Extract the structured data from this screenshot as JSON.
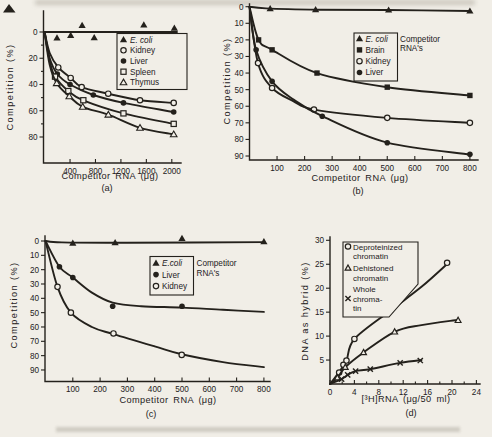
{
  "colors": {
    "ink": "#24211c",
    "paper": "#f1eee7"
  },
  "artifacts": {
    "stray_mark": "filled-triangle-top-left",
    "top_smudge": true,
    "caption_smudge": true
  },
  "chart_data": [
    {
      "panel": "a",
      "type": "line",
      "panel_label": "(a)",
      "xlabel": "Competitor RNA (μg)",
      "ylabel": "Competition (%)",
      "x_ticks": [
        400,
        800,
        1200,
        1600,
        2000
      ],
      "y_ticks": [
        0,
        20,
        40,
        60,
        80
      ],
      "y_minor": [
        10,
        30,
        50,
        70
      ],
      "xlim": [
        0,
        2100
      ],
      "ylim": [
        -8,
        100
      ],
      "y_axis_inverted_downward": true,
      "grid": false,
      "series": [
        {
          "name": "E. coli",
          "italic": true,
          "marker": "triangle-filled",
          "lw": 2.2,
          "line": [
            [
              0,
              0
            ],
            [
              2080,
              0
            ]
          ],
          "markers": [
            [
              195,
              4.5
            ],
            [
              410,
              2.5
            ],
            [
              590,
              -5
            ],
            [
              780,
              4.3
            ],
            [
              1560,
              -5.5
            ],
            [
              2040,
              -3
            ]
          ]
        },
        {
          "name": "Kidney",
          "marker": "circle-open",
          "line": [
            [
              0,
              0
            ],
            [
              80,
              16
            ],
            [
              215,
              27
            ],
            [
              410,
              35
            ],
            [
              583,
              42
            ],
            [
              1000,
              47
            ],
            [
              1500,
              52
            ],
            [
              2030,
              54
            ]
          ],
          "markers": [
            [
              215,
              27
            ],
            [
              410,
              35
            ],
            [
              583,
              42
            ],
            [
              1000,
              47
            ],
            [
              1500,
              52
            ],
            [
              2030,
              54
            ]
          ]
        },
        {
          "name": "Liver",
          "marker": "circle-filled",
          "line": [
            [
              0,
              0
            ],
            [
              80,
              20
            ],
            [
              200,
              32
            ],
            [
              400,
              40
            ],
            [
              766,
              48
            ],
            [
              1240,
              54
            ],
            [
              2030,
              61
            ]
          ],
          "markers": [
            [
              200,
              32
            ],
            [
              400,
              40
            ],
            [
              766,
              48
            ],
            [
              1240,
              54
            ],
            [
              2030,
              61
            ]
          ]
        },
        {
          "name": "Spleen",
          "marker": "square-open",
          "line": [
            [
              0,
              0
            ],
            [
              80,
              22
            ],
            [
              164,
              34
            ],
            [
              373,
              45
            ],
            [
              609,
              52
            ],
            [
              1240,
              62
            ],
            [
              2030,
              70
            ]
          ],
          "markers": [
            [
              164,
              34
            ],
            [
              373,
              45
            ],
            [
              609,
              52
            ],
            [
              1240,
              62
            ],
            [
              2030,
              70
            ]
          ]
        },
        {
          "name": "Thymus",
          "marker": "triangle-open",
          "line": [
            [
              0,
              0
            ],
            [
              80,
              25
            ],
            [
              190,
              39
            ],
            [
              388,
              49
            ],
            [
              599,
              57
            ],
            [
              1002,
              63
            ],
            [
              1500,
              73
            ],
            [
              2030,
              78
            ]
          ],
          "markers": [
            [
              190,
              39
            ],
            [
              388,
              49
            ],
            [
              599,
              57
            ],
            [
              1002,
              63
            ],
            [
              1500,
              73
            ],
            [
              2030,
              78
            ]
          ]
        }
      ],
      "legend": {
        "entries": [
          {
            "marker": "triangle-filled",
            "label": "E. coli",
            "italic": true
          },
          {
            "marker": "circle-open",
            "label": "Kidney"
          },
          {
            "marker": "circle-filled",
            "label": "Liver"
          },
          {
            "marker": "square-open",
            "label": "Spleen"
          },
          {
            "marker": "triangle-open",
            "label": "Thymus"
          }
        ]
      }
    },
    {
      "panel": "b",
      "type": "line",
      "panel_label": "(b)",
      "xlabel": "Competitor RNA (μg)",
      "ylabel": "Competition (%)",
      "x_ticks": [
        100,
        200,
        300,
        400,
        500,
        600,
        700,
        800
      ],
      "y_ticks": [
        0,
        10,
        20,
        30,
        40,
        50,
        60,
        70,
        80,
        90
      ],
      "xlim": [
        0,
        830
      ],
      "ylim": [
        0,
        92
      ],
      "y_axis_inverted_downward": true,
      "grid": false,
      "series": [
        {
          "name": "E. coli",
          "italic": true,
          "marker": "triangle-filled",
          "line": [
            [
              0,
              0
            ],
            [
              60,
              1
            ],
            [
              250,
              1.8
            ],
            [
              500,
              2
            ],
            [
              800,
              2.6
            ]
          ],
          "markers": [
            [
              75,
              1.2
            ],
            [
              240,
              1.8
            ],
            [
              505,
              2
            ],
            [
              800,
              2.6
            ]
          ]
        },
        {
          "name": "Brain",
          "marker": "square-filled",
          "line": [
            [
              0,
              0
            ],
            [
              33,
              20
            ],
            [
              82,
              26
            ],
            [
              245,
              40
            ],
            [
              500,
              48.5
            ],
            [
              800,
              53.5
            ]
          ],
          "markers": [
            [
              33,
              20
            ],
            [
              82,
              26
            ],
            [
              245,
              40
            ],
            [
              500,
              48.5
            ],
            [
              800,
              53.5
            ]
          ]
        },
        {
          "name": "Kidney",
          "marker": "circle-open",
          "line": [
            [
              0,
              0
            ],
            [
              31,
              34
            ],
            [
              82,
              49
            ],
            [
              160,
              57
            ],
            [
              234,
              62
            ],
            [
              500,
              67
            ],
            [
              800,
              70
            ]
          ],
          "markers": [
            [
              31,
              34
            ],
            [
              82,
              49
            ],
            [
              234,
              62
            ],
            [
              500,
              67
            ],
            [
              800,
              70
            ]
          ]
        },
        {
          "name": "Liver",
          "marker": "circle-filled",
          "line": [
            [
              0,
              0
            ],
            [
              24,
              26
            ],
            [
              82,
              45
            ],
            [
              160,
              56
            ],
            [
              264,
              66
            ],
            [
              500,
              82
            ],
            [
              800,
              89
            ]
          ],
          "markers": [
            [
              24,
              26
            ],
            [
              82,
              45
            ],
            [
              264,
              66
            ],
            [
              500,
              82
            ],
            [
              800,
              89
            ]
          ]
        }
      ],
      "legend": {
        "entries": [
          {
            "marker": "triangle-filled",
            "label": "E. coli",
            "italic": true
          },
          {
            "marker": "square-filled",
            "label": "Brain"
          },
          {
            "marker": "circle-open",
            "label": "Kidney"
          },
          {
            "marker": "circle-filled",
            "label": "Liver"
          }
        ],
        "side_text": [
          "Competitor",
          "RNA's"
        ]
      }
    },
    {
      "panel": "c",
      "type": "line",
      "panel_label": "(c)",
      "xlabel": "Competitor RNA (μg)",
      "ylabel": "Competition (%)",
      "x_ticks": [
        100,
        200,
        300,
        400,
        500,
        600,
        700,
        800
      ],
      "y_ticks": [
        0,
        10,
        20,
        30,
        40,
        50,
        60,
        70,
        80,
        90
      ],
      "xlim": [
        0,
        830
      ],
      "ylim": [
        -4,
        98
      ],
      "y_axis_inverted_downward": true,
      "grid": false,
      "series": [
        {
          "name": "E.coli",
          "italic": true,
          "marker": "triangle-filled",
          "line": [
            [
              0,
              0
            ],
            [
              60,
              1
            ],
            [
              300,
              1.2
            ],
            [
              800,
              0.8
            ]
          ],
          "markers": [
            [
              100,
              1.5
            ],
            [
              255,
              1.2
            ],
            [
              500,
              -1.9
            ],
            [
              800,
              0.5
            ]
          ]
        },
        {
          "name": "Liver",
          "marker": "circle-filled",
          "line": [
            [
              0,
              0
            ],
            [
              51,
              18
            ],
            [
              100,
              25.5
            ],
            [
              170,
              36
            ],
            [
              246,
              43
            ],
            [
              350,
              45.5
            ],
            [
              500,
              46.5
            ],
            [
              650,
              48
            ],
            [
              800,
              49.5
            ]
          ],
          "markers": [
            [
              51,
              18
            ],
            [
              100,
              25.5
            ],
            [
              246,
              45.5
            ],
            [
              500,
              45.5
            ]
          ]
        },
        {
          "name": "Kidney",
          "marker": "circle-open",
          "line": [
            [
              0,
              0
            ],
            [
              44,
              32
            ],
            [
              93,
              50
            ],
            [
              170,
              60
            ],
            [
              249,
              65
            ],
            [
              400,
              73.5
            ],
            [
              499,
              79
            ],
            [
              650,
              84.5
            ],
            [
              800,
              88
            ]
          ],
          "markers": [
            [
              44,
              32
            ],
            [
              93,
              50
            ],
            [
              249,
              64.5
            ],
            [
              499,
              79.5
            ]
          ]
        }
      ],
      "legend": {
        "entries": [
          {
            "marker": "triangle-filled",
            "label": "E.coli",
            "italic": true
          },
          {
            "marker": "circle-filled",
            "label": "Liver"
          },
          {
            "marker": "circle-open",
            "label": "Kidney"
          }
        ],
        "side_text": [
          "Competitor",
          "RNA's"
        ]
      }
    },
    {
      "panel": "d",
      "type": "line",
      "panel_label": "(d)",
      "xlabel": "[³H]RNA (μg/50 ml)",
      "ylabel": "DNA as hybrid (%)",
      "x_ticks": [
        0,
        4,
        8,
        12,
        16,
        20,
        24
      ],
      "x_minor": [
        2,
        6,
        10,
        14,
        18,
        22
      ],
      "y_ticks": [
        5,
        10,
        15,
        20,
        25,
        30
      ],
      "xlim": [
        0,
        24.5
      ],
      "ylim": [
        0,
        30
      ],
      "y_axis_inverted_downward": false,
      "grid": false,
      "series": [
        {
          "name": "Deproteinized chromatin",
          "marker": "circle-open",
          "line": [
            [
              0,
              0
            ],
            [
              1.5,
              2.5
            ],
            [
              2.7,
              4.9
            ],
            [
              4,
              9.4
            ],
            [
              10,
              15.4
            ],
            [
              15,
              20.3
            ],
            [
              19.5,
              25.4
            ]
          ],
          "markers": [
            [
              1.5,
              2.4
            ],
            [
              2.2,
              4
            ],
            [
              2.7,
              4.9
            ],
            [
              4,
              9.4
            ],
            [
              9.9,
              15.4
            ],
            [
              19.2,
              25.3
            ]
          ]
        },
        {
          "name": "Dehistoned chromatin",
          "marker": "triangle-open-small",
          "line": [
            [
              0,
              0
            ],
            [
              1.2,
              1.3
            ],
            [
              2.5,
              3.5
            ],
            [
              5.5,
              6.6
            ],
            [
              10.6,
              10.9
            ],
            [
              15,
              12.3
            ],
            [
              21,
              13.4
            ]
          ],
          "markers": [
            [
              1.2,
              1.3
            ],
            [
              2.5,
              3.5
            ],
            [
              5.5,
              6.6
            ],
            [
              10.6,
              10.9
            ],
            [
              21,
              13.3
            ]
          ]
        },
        {
          "name": "Whole chromatin",
          "marker": "cross",
          "line": [
            [
              0,
              0
            ],
            [
              1.9,
              1
            ],
            [
              3,
              2
            ],
            [
              4.2,
              2.7
            ],
            [
              6.6,
              3.1
            ],
            [
              11.5,
              4.4
            ],
            [
              15,
              5
            ]
          ],
          "markers": [
            [
              1.9,
              1
            ],
            [
              2.9,
              1.9
            ],
            [
              4.2,
              2.7
            ],
            [
              6.6,
              3.1
            ],
            [
              11.5,
              4.4
            ],
            [
              14.8,
              4.9
            ]
          ]
        }
      ],
      "legend": {
        "entries": [
          {
            "marker": "circle-open",
            "label": [
              "Deproteinized",
              "chromatin"
            ]
          },
          {
            "marker": "triangle-open-small",
            "label": [
              "Dehistoned",
              "chromatin"
            ]
          },
          {
            "marker": "cross",
            "label": [
              "Whole",
              "chroma-",
              "tin"
            ]
          }
        ]
      }
    }
  ]
}
